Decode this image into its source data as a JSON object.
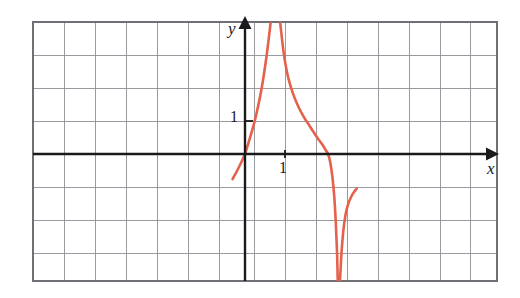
{
  "figure": {
    "background_color": "#ffffff",
    "curve_color": "#e4614b",
    "axis_color": "#1a1a1c",
    "grid_color": "#8e9096",
    "border_color": "#6e7076"
  },
  "axes": {
    "x_axis_label": "x",
    "y_axis_label": "y",
    "x_tick_label": "1",
    "y_tick_label": "1"
  },
  "chart_data": {
    "type": "line",
    "title": "",
    "xlabel": "x",
    "ylabel": "y",
    "grid": true,
    "legend": null,
    "xlim": [
      -7,
      8.5
    ],
    "ylim": [
      -4,
      4
    ],
    "x_ticks": [
      1
    ],
    "y_ticks": [
      1
    ],
    "x_tick_labels": [
      "1"
    ],
    "y_tick_labels": [
      "1"
    ],
    "grid_spacing_x": 1,
    "grid_spacing_y": 1,
    "annotations": [
      "vertical asymptote at x = 1",
      "curve passes through the origin",
      "local minimum near x = -1.5, y = -1.3",
      "downward spike (zero/cusp) near x = 3",
      "local maximum near x = 5, y = -0.8",
      "approaches horizontal level y = -1.8 on the right",
      "approaches horizontal level y = 1.9 on the left"
    ],
    "series": [
      {
        "name": "f(x)",
        "points": [
          [
            -7.0,
            1.88
          ],
          [
            -6.7,
            1.87
          ],
          [
            -6.4,
            1.85
          ],
          [
            -6.1,
            1.8
          ],
          [
            -5.8,
            1.72
          ],
          [
            -5.5,
            1.62
          ],
          [
            -5.2,
            1.48
          ],
          [
            -4.9,
            1.32
          ],
          [
            -4.6,
            1.14
          ],
          [
            -4.3,
            0.94
          ],
          [
            -4.0,
            0.72
          ],
          [
            -3.7,
            0.5
          ],
          [
            -3.4,
            0.28
          ],
          [
            -3.1,
            0.06
          ],
          [
            -2.9,
            -0.1
          ],
          [
            -2.6,
            -0.38
          ],
          [
            -2.3,
            -0.66
          ],
          [
            -2.0,
            -0.95
          ],
          [
            -1.8,
            -1.12
          ],
          [
            -1.6,
            -1.24
          ],
          [
            -1.4,
            -1.3
          ],
          [
            -1.2,
            -1.3
          ],
          [
            -1.0,
            -1.25
          ],
          [
            -0.8,
            -1.16
          ],
          [
            -0.6,
            -1.0
          ],
          [
            -0.4,
            -0.76
          ],
          [
            -0.25,
            -0.5
          ],
          [
            -0.12,
            -0.25
          ],
          [
            0.0,
            0.0
          ],
          [
            0.1,
            0.3
          ],
          [
            0.2,
            0.62
          ],
          [
            0.3,
            0.95
          ],
          [
            0.4,
            1.35
          ],
          [
            0.5,
            1.8
          ],
          [
            0.6,
            2.35
          ],
          [
            0.7,
            3.0
          ],
          [
            0.78,
            3.6
          ],
          [
            0.84,
            4.1
          ],
          [
            1.12,
            4.1
          ],
          [
            1.18,
            3.6
          ],
          [
            1.25,
            3.05
          ],
          [
            1.35,
            2.5
          ],
          [
            1.45,
            2.12
          ],
          [
            1.6,
            1.7
          ],
          [
            1.75,
            1.38
          ],
          [
            1.9,
            1.12
          ],
          [
            2.05,
            0.9
          ],
          [
            2.2,
            0.68
          ],
          [
            2.35,
            0.47
          ],
          [
            2.5,
            0.28
          ],
          [
            2.6,
            0.12
          ],
          [
            2.68,
            0.0
          ],
          [
            2.75,
            -0.25
          ],
          [
            2.82,
            -0.7
          ],
          [
            2.88,
            -1.3
          ],
          [
            2.93,
            -2.1
          ],
          [
            2.97,
            -3.0
          ],
          [
            3.0,
            -4.0
          ],
          [
            3.05,
            -4.0
          ],
          [
            3.12,
            -2.9
          ],
          [
            3.2,
            -2.1
          ],
          [
            3.3,
            -1.6
          ],
          [
            3.45,
            -1.25
          ],
          [
            3.6,
            -1.05
          ],
          [
            3.8,
            -0.92
          ],
          [
            4.0,
            -0.85
          ],
          [
            4.3,
            -0.8
          ],
          [
            4.6,
            -0.78
          ],
          [
            4.9,
            -0.78
          ],
          [
            5.2,
            -0.82
          ],
          [
            5.5,
            -0.9
          ],
          [
            5.8,
            -1.02
          ],
          [
            6.1,
            -1.16
          ],
          [
            6.4,
            -1.3
          ],
          [
            6.7,
            -1.42
          ],
          [
            7.0,
            -1.52
          ],
          [
            7.3,
            -1.6
          ],
          [
            7.6,
            -1.66
          ],
          [
            7.9,
            -1.72
          ],
          [
            8.2,
            -1.75
          ],
          [
            8.5,
            -1.78
          ]
        ]
      }
    ]
  }
}
